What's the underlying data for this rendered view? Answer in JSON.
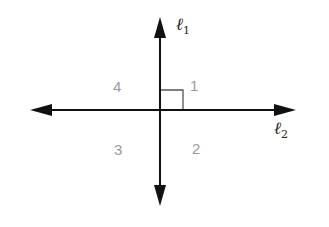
{
  "diagram": {
    "lines": [
      {
        "name": "ℓ",
        "subscript": "1",
        "orientation": "vertical"
      },
      {
        "name": "ℓ",
        "subscript": "2",
        "orientation": "horizontal"
      }
    ],
    "angles": [
      {
        "label": "1",
        "position": "upper-right",
        "right_angle_marked": true
      },
      {
        "label": "2",
        "position": "lower-right"
      },
      {
        "label": "3",
        "position": "lower-left"
      },
      {
        "label": "4",
        "position": "upper-left"
      }
    ],
    "colors": {
      "lines": "#111111",
      "angle_labels": "#9a9a9a",
      "right_angle_mark": "#555555"
    }
  }
}
